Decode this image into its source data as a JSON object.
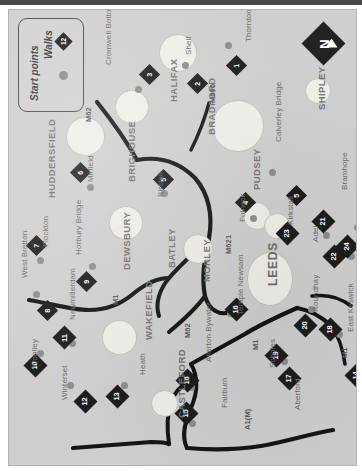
{
  "map": {
    "title": "Walks around Leeds, Bradford and Wakefield",
    "orientation": "page rotated 90 degrees clockwise",
    "colors": {
      "paper": "#cfcfcf",
      "urban_blob": "#efefe9",
      "marker_diamond": "#1d1d1d",
      "start_dot": "#8d8d8d",
      "road": "#151515",
      "label_text": "#5e5e5e"
    },
    "legend": {
      "walks_label": "Walks",
      "walks_marker_number": "12",
      "start_points_label": "Start points"
    },
    "compass": {
      "letter": "N",
      "icon": "north-arrow-icon"
    },
    "towns": [
      {
        "name": "HALIFAX",
        "class": "town",
        "x": 160,
        "y": 92
      },
      {
        "name": "BRIGHOUSE",
        "class": "town",
        "x": 118,
        "y": 172
      },
      {
        "name": "HUDDERSFIELD",
        "class": "town",
        "x": 38,
        "y": 188
      },
      {
        "name": "BRADFORD",
        "class": "town",
        "x": 198,
        "y": 125
      },
      {
        "name": "SHIPLEY",
        "class": "town",
        "x": 308,
        "y": 100
      },
      {
        "name": "PUDSEY",
        "class": "town",
        "x": 243,
        "y": 180
      },
      {
        "name": "DEWSBURY",
        "class": "town",
        "x": 113,
        "y": 260
      },
      {
        "name": "BATLEY",
        "class": "town",
        "x": 158,
        "y": 258
      },
      {
        "name": "MORLEY",
        "class": "town",
        "x": 193,
        "y": 272
      },
      {
        "name": "LEEDS",
        "class": "city",
        "x": 258,
        "y": 276
      },
      {
        "name": "WAKEFIELD",
        "class": "town",
        "x": 135,
        "y": 330
      },
      {
        "name": "CASTLEFORD",
        "class": "town",
        "x": 168,
        "y": 408
      }
    ],
    "villages": [
      {
        "name": "Cromwell Bottom",
        "x": 96,
        "y": 55
      },
      {
        "name": "Shelf",
        "x": 176,
        "y": 45
      },
      {
        "name": "Thornton",
        "x": 236,
        "y": 32
      },
      {
        "name": "Mirfield",
        "x": 78,
        "y": 172
      },
      {
        "name": "Birstall",
        "x": 148,
        "y": 187
      },
      {
        "name": "Calverley Bridge",
        "x": 266,
        "y": 132
      },
      {
        "name": "Fulneck",
        "x": 230,
        "y": 212
      },
      {
        "name": "Kirkstall",
        "x": 278,
        "y": 215
      },
      {
        "name": "Adel",
        "x": 303,
        "y": 232
      },
      {
        "name": "Bramhope",
        "x": 332,
        "y": 180
      },
      {
        "name": "Flockton",
        "x": 33,
        "y": 237
      },
      {
        "name": "Horbury Bridge",
        "x": 66,
        "y": 245
      },
      {
        "name": "West Bretton",
        "x": 12,
        "y": 268
      },
      {
        "name": "Newmillerdam",
        "x": 60,
        "y": 310
      },
      {
        "name": "Woolley",
        "x": 22,
        "y": 358
      },
      {
        "name": "Winterset",
        "x": 52,
        "y": 390
      },
      {
        "name": "Heath",
        "x": 130,
        "y": 365
      },
      {
        "name": "Allerton Bywater",
        "x": 196,
        "y": 352
      },
      {
        "name": "Fairburn",
        "x": 212,
        "y": 398
      },
      {
        "name": "Temple Newsam",
        "x": 228,
        "y": 305
      },
      {
        "name": "Scholes",
        "x": 260,
        "y": 358
      },
      {
        "name": "Aberford",
        "x": 285,
        "y": 400
      },
      {
        "name": "Roundhay",
        "x": 303,
        "y": 302
      },
      {
        "name": "East Keswick",
        "x": 338,
        "y": 322
      }
    ],
    "roads": [
      {
        "name": "M62",
        "x": 76,
        "y": 112
      },
      {
        "name": "M606",
        "x": 200,
        "y": 93
      },
      {
        "name": "M621",
        "x": 216,
        "y": 244
      },
      {
        "name": "M62",
        "x": 175,
        "y": 328
      },
      {
        "name": "M1",
        "x": 103,
        "y": 295
      },
      {
        "name": "M1",
        "x": 332,
        "y": 348
      },
      {
        "name": "M1",
        "x": 243,
        "y": 340
      },
      {
        "name": "A1(M)",
        "x": 235,
        "y": 420
      }
    ],
    "walks": [
      {
        "number": "1",
        "near": "Thornton",
        "x": 220,
        "y": 48
      },
      {
        "number": "2",
        "near": "Shelf",
        "x": 181,
        "y": 66
      },
      {
        "number": "3",
        "near": "Cromwell Bottom",
        "x": 133,
        "y": 57
      },
      {
        "number": "4",
        "near": "Fulneck",
        "x": 229,
        "y": 185
      },
      {
        "number": "5",
        "near": "Calverley Bridge",
        "x": 280,
        "y": 178
      },
      {
        "number": "6",
        "near": "Mirfield",
        "x": 64,
        "y": 155
      },
      {
        "number": "7",
        "near": "Flockton",
        "x": 20,
        "y": 228
      },
      {
        "number": "8",
        "near": "West Bretton",
        "x": 31,
        "y": 293
      },
      {
        "number": "9",
        "near": "Horbury Bridge",
        "x": 70,
        "y": 264
      },
      {
        "number": "10",
        "near": "Woolley",
        "x": 18,
        "y": 347
      },
      {
        "number": "11",
        "near": "Newmillerdam",
        "x": 47,
        "y": 319
      },
      {
        "number": "12",
        "near": "Winterset",
        "x": 68,
        "y": 383
      },
      {
        "number": "13",
        "near": "Heath",
        "x": 100,
        "y": 378
      },
      {
        "number": "14",
        "near": "Castleford east",
        "x": 339,
        "y": 357
      },
      {
        "number": "15",
        "near": "Fairburn",
        "x": 169,
        "y": 395
      },
      {
        "number": "16",
        "near": "Allerton Bywater",
        "x": 170,
        "y": 362
      },
      {
        "number": "16",
        "near": "Temple Newsam",
        "x": 219,
        "y": 291
      },
      {
        "number": "17",
        "near": "Aberford",
        "x": 272,
        "y": 360
      },
      {
        "number": "18",
        "near": "East Keswick",
        "x": 313,
        "y": 311
      },
      {
        "number": "19",
        "near": "Scholes",
        "x": 259,
        "y": 337
      },
      {
        "number": "20",
        "near": "Roundhay",
        "x": 288,
        "y": 307
      },
      {
        "number": "21",
        "near": "Bramhope",
        "x": 306,
        "y": 203
      },
      {
        "number": "22",
        "near": "Adel",
        "x": 317,
        "y": 238
      },
      {
        "number": "23",
        "near": "Kirkstall",
        "x": 270,
        "y": 215
      },
      {
        "number": "24",
        "near": "north Leeds",
        "x": 330,
        "y": 228
      },
      {
        "number": "5",
        "near": "Birstall",
        "x": 147,
        "y": 162
      }
    ],
    "start_points": [
      {
        "x": 126,
        "y": 76
      },
      {
        "x": 173,
        "y": 52
      },
      {
        "x": 216,
        "y": 32
      },
      {
        "x": 78,
        "y": 174
      },
      {
        "x": 152,
        "y": 180
      },
      {
        "x": 260,
        "y": 159
      },
      {
        "x": 241,
        "y": 205
      },
      {
        "x": 281,
        "y": 221
      },
      {
        "x": 314,
        "y": 222
      },
      {
        "x": 345,
        "y": 214
      },
      {
        "x": 28,
        "y": 247
      },
      {
        "x": 80,
        "y": 253
      },
      {
        "x": 24,
        "y": 281
      },
      {
        "x": 60,
        "y": 330
      },
      {
        "x": 28,
        "y": 340
      },
      {
        "x": 58,
        "y": 372
      },
      {
        "x": 112,
        "y": 372
      },
      {
        "x": 179,
        "y": 374
      },
      {
        "x": 180,
        "y": 410
      },
      {
        "x": 218,
        "y": 300
      },
      {
        "x": 272,
        "y": 348
      },
      {
        "x": 277,
        "y": 372
      },
      {
        "x": 299,
        "y": 296
      },
      {
        "x": 327,
        "y": 321
      },
      {
        "x": 345,
        "y": 370
      },
      {
        "x": 339,
        "y": 243
      }
    ],
    "urban_blobs": [
      {
        "x": 150,
        "y": 24,
        "w": 36,
        "h": 36
      },
      {
        "x": 106,
        "y": 80,
        "w": 32,
        "h": 32
      },
      {
        "x": 57,
        "y": 107,
        "w": 37,
        "h": 37
      },
      {
        "x": 203,
        "y": 90,
        "w": 50,
        "h": 50
      },
      {
        "x": 296,
        "y": 68,
        "w": 24,
        "h": 24
      },
      {
        "x": 234,
        "y": 192,
        "w": 26,
        "h": 26
      },
      {
        "x": 255,
        "y": 203,
        "w": 24,
        "h": 24
      },
      {
        "x": 100,
        "y": 196,
        "w": 32,
        "h": 32
      },
      {
        "x": 174,
        "y": 224,
        "w": 28,
        "h": 28
      },
      {
        "x": 238,
        "y": 242,
        "w": 44,
        "h": 52
      },
      {
        "x": 93,
        "y": 310,
        "w": 33,
        "h": 33
      },
      {
        "x": 142,
        "y": 380,
        "w": 25,
        "h": 25
      }
    ]
  }
}
